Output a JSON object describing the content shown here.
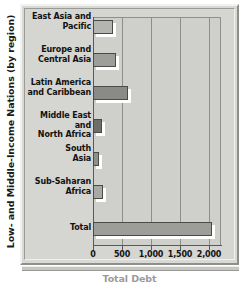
{
  "chart_data": {
    "type": "bar",
    "orientation": "horizontal",
    "title": "",
    "xlabel": "Total Debt",
    "ylabel": "Low- and Middle-Income Nations (by region)",
    "categories": [
      "East Asia and Pacific",
      "Europe and Central Asia",
      "Latin America and Caribbean",
      "Middle East and North Africa",
      "South Asia",
      "Sub-Saharan Africa",
      "Total"
    ],
    "values": [
      350,
      400,
      600,
      150,
      110,
      170,
      2050
    ],
    "xlim": [
      0,
      2200
    ],
    "xticks": [
      0,
      500,
      1000,
      1500,
      2000
    ],
    "xtick_labels": [
      "0",
      "500",
      "1,000",
      "1,500",
      "2,000"
    ],
    "grid": "vertical",
    "legend": "none",
    "bar_colors": [
      "#b4b4b0",
      "#9d9d99",
      "#8a8a86",
      "#6e6e6a",
      "#8f8f8b",
      "#a8a8a4",
      "#9d9d99"
    ]
  },
  "axis": {
    "y_title": "Low- and Middle-Income Nations (by region)",
    "x_title": "Total Debt"
  },
  "categories": [
    {
      "line1": "East Asia and",
      "line2": "Pacific"
    },
    {
      "line1": "Europe and",
      "line2": "Central Asia"
    },
    {
      "line1": "Latin America",
      "line2": "and Caribbean"
    },
    {
      "line1": "Middle East and",
      "line2": "North Africa"
    },
    {
      "line1": "South",
      "line2": "Asia"
    },
    {
      "line1": "Sub-Saharan",
      "line2": "Africa"
    },
    {
      "line1": "Total",
      "line2": ""
    }
  ],
  "xticks": [
    {
      "label": "0"
    },
    {
      "label": "500"
    },
    {
      "label": "1,000"
    },
    {
      "label": "1,500"
    },
    {
      "label": "2,000"
    }
  ]
}
